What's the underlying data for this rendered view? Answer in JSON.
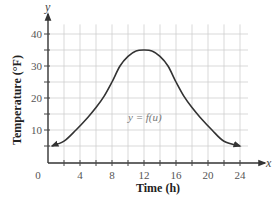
{
  "chart_data": {
    "type": "line",
    "title": "",
    "xlabel": "Time (h)",
    "ylabel": "Temperature (°F)",
    "x_axis_var": "x",
    "y_axis_var": "y",
    "function_label": "y = f(u)",
    "xlim": [
      0,
      25
    ],
    "ylim": [
      0,
      43
    ],
    "x_ticks": [
      0,
      4,
      8,
      12,
      16,
      20,
      24
    ],
    "y_ticks": [
      10,
      20,
      30,
      40
    ],
    "x_minor_step": 2,
    "y_minor_step": 5,
    "grid": true,
    "legend": null,
    "series": [
      {
        "name": "f",
        "x": [
          0.5,
          2,
          3.5,
          5,
          6,
          7,
          8,
          9,
          10,
          11,
          12,
          13,
          14,
          15,
          16,
          17,
          18,
          19,
          20.5,
          22,
          24
        ],
        "y": [
          5,
          6.5,
          10,
          14,
          17,
          20.5,
          25,
          30,
          33,
          34.7,
          35,
          34.7,
          33,
          30,
          25,
          20.5,
          17,
          14,
          10,
          6.5,
          5
        ],
        "arrows_at_ends": true
      }
    ],
    "annotations": [
      {
        "text": "y = f(u)",
        "x": 13,
        "y": 14
      }
    ]
  }
}
